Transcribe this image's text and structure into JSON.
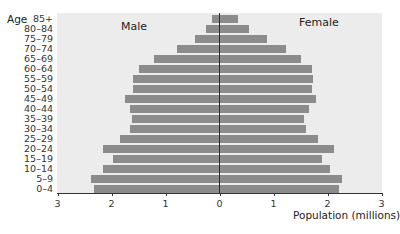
{
  "chart_data": {
    "type": "bar",
    "orientation": "horizontal",
    "subtype": "population-pyramid",
    "title": "",
    "xlabel": "Population (millions)",
    "ylabel": "Age",
    "xlim": [
      -3,
      3
    ],
    "xticks": [
      3,
      2,
      1,
      0,
      1,
      2,
      3
    ],
    "categories": [
      "85+",
      "80–84",
      "75–79",
      "70–74",
      "65–69",
      "60–64",
      "55–59",
      "50–54",
      "45–49",
      "40–44",
      "35–39",
      "30–34",
      "25–29",
      "20–24",
      "15–19",
      "10–14",
      "5–9",
      "0–4"
    ],
    "series": [
      {
        "name": "Male",
        "values": [
          0.14,
          0.25,
          0.45,
          0.79,
          1.21,
          1.49,
          1.6,
          1.6,
          1.75,
          1.66,
          1.62,
          1.66,
          1.84,
          2.16,
          1.97,
          2.16,
          2.38,
          2.32
        ]
      },
      {
        "name": "Female",
        "values": [
          0.34,
          0.55,
          0.88,
          1.23,
          1.51,
          1.71,
          1.73,
          1.71,
          1.79,
          1.66,
          1.57,
          1.6,
          1.82,
          2.12,
          1.9,
          2.05,
          2.27,
          2.21
        ]
      }
    ],
    "grid": false,
    "legend": "inline labels: Male (left), Female (right)",
    "colors": {
      "bar": "#8c8c8c",
      "background": "#ececec",
      "center_line": "#2a2a2a"
    }
  },
  "labels": {
    "age_title": "Age",
    "male": "Male",
    "female": "Female",
    "xlabel": "Population (millions)"
  }
}
